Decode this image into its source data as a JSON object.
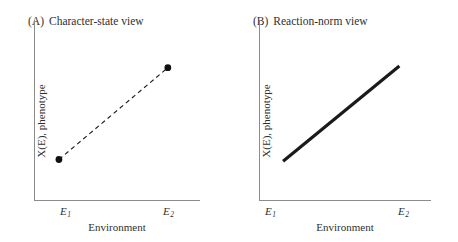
{
  "figure": {
    "background_color": "#ffffff",
    "ink_color": "#1a1a1a",
    "axis_color": "#8c8c8c",
    "text_color": "#2f2f2f"
  },
  "panels": [
    {
      "tag": "(A)",
      "title": "Character-state view",
      "y_axis_label": "X(E), phenotype",
      "x_axis_label": "Environment",
      "ticks": [
        {
          "symbol": "E",
          "subscript": "1"
        },
        {
          "symbol": "E",
          "subscript": "2"
        }
      ],
      "series": {
        "style": "dashed",
        "markers": "filled-circle",
        "line_width": 1.1,
        "marker_radius": 3.4,
        "points": [
          {
            "x": 0.145,
            "y": 0.225
          },
          {
            "x": 0.805,
            "y": 0.735
          }
        ]
      }
    },
    {
      "tag": "(B)",
      "title": "Reaction-norm view",
      "y_axis_label": "X(E), phenotype",
      "x_axis_label": "Environment",
      "ticks": [
        {
          "symbol": "E",
          "subscript": "1"
        },
        {
          "symbol": "E",
          "subscript": "2"
        }
      ],
      "series": {
        "style": "solid",
        "markers": "none",
        "line_width": 3.2,
        "marker_radius": 0,
        "points": [
          {
            "x": 0.135,
            "y": 0.215
          },
          {
            "x": 0.815,
            "y": 0.745
          }
        ]
      }
    }
  ],
  "chart_data": {
    "type": "line",
    "title": "",
    "panels": [
      {
        "label": "(A) Character-state view",
        "xlabel": "Environment",
        "ylabel": "X(E), phenotype",
        "xticklabels": [
          "E1",
          "E2"
        ],
        "yticklabels": [],
        "xlim": [
          0,
          1
        ],
        "ylim": [
          0,
          1
        ],
        "grid": false,
        "legend": "none",
        "series": [
          {
            "name": "character-state",
            "linestyle": "dashed",
            "marker": "filled-circle",
            "x": [
              0.145,
              0.805
            ],
            "y": [
              0.225,
              0.735
            ]
          }
        ]
      },
      {
        "label": "(B) Reaction-norm view",
        "xlabel": "Environment",
        "ylabel": "X(E), phenotype",
        "xticklabels": [
          "E1",
          "E2"
        ],
        "yticklabels": [],
        "xlim": [
          0,
          1
        ],
        "ylim": [
          0,
          1
        ],
        "grid": false,
        "legend": "none",
        "series": [
          {
            "name": "reaction-norm",
            "linestyle": "solid",
            "marker": "none",
            "x": [
              0.135,
              0.815
            ],
            "y": [
              0.215,
              0.745
            ]
          }
        ]
      }
    ]
  }
}
